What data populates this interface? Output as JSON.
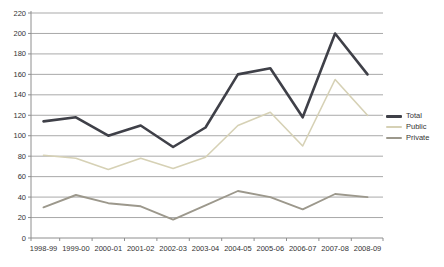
{
  "chart_data": {
    "type": "line",
    "title": "",
    "xlabel": "",
    "ylabel": "",
    "categories": [
      "1998-99",
      "1999-00",
      "2000-01",
      "2001-02",
      "2002-03",
      "2003-04",
      "2004-05",
      "2005-06",
      "2006-07",
      "2007-08",
      "2008-09"
    ],
    "series": [
      {
        "name": "Total",
        "color": "#3f4048",
        "stroke_width": 2.6,
        "values": [
          114,
          118,
          100,
          110,
          89,
          108,
          160,
          166,
          118,
          200,
          160
        ]
      },
      {
        "name": "Public",
        "color": "#d6d1b5",
        "stroke_width": 1.6,
        "values": [
          81,
          78,
          67,
          78,
          68,
          79,
          110,
          123,
          90,
          155,
          120
        ]
      },
      {
        "name": "Private",
        "color": "#9c988c",
        "stroke_width": 1.9,
        "values": [
          30,
          42,
          34,
          31,
          18,
          32,
          46,
          40,
          28,
          43,
          40
        ]
      }
    ],
    "ylim": [
      0,
      220
    ],
    "yticks": [
      0,
      20,
      40,
      60,
      80,
      100,
      120,
      140,
      160,
      180,
      200,
      220
    ],
    "grid": true,
    "legend_position": "right"
  },
  "style": {
    "grid_color": "#a9a9a9",
    "axis_color": "#8e8e8e",
    "label_color": "#333333",
    "background": "#ffffff"
  }
}
